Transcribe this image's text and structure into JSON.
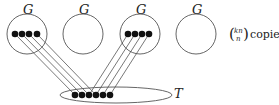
{
  "diagram": {
    "graph_label": "G",
    "graphs": [
      {
        "label": "G",
        "cx": 27,
        "cy": 34,
        "r": 20,
        "dots": [
          15,
          22,
          29,
          37
        ]
      },
      {
        "label": "G",
        "cx": 83,
        "cy": 34,
        "r": 20,
        "dots": []
      },
      {
        "label": "G",
        "cx": 140,
        "cy": 34,
        "r": 20,
        "dots": [
          128,
          135,
          142,
          149
        ]
      },
      {
        "label": "G",
        "cx": 196,
        "cy": 34,
        "r": 20,
        "dots": []
      }
    ],
    "target": {
      "label": "T",
      "cx": 116,
      "cy": 95,
      "rx": 56,
      "ry": 8,
      "dots": [
        75,
        82,
        89,
        96,
        103,
        110
      ]
    },
    "copies": {
      "binom_top": "kn",
      "binom_bottom": "n",
      "text": "copies"
    },
    "colors": {
      "stroke": "#555555",
      "dot": "#111111"
    }
  }
}
